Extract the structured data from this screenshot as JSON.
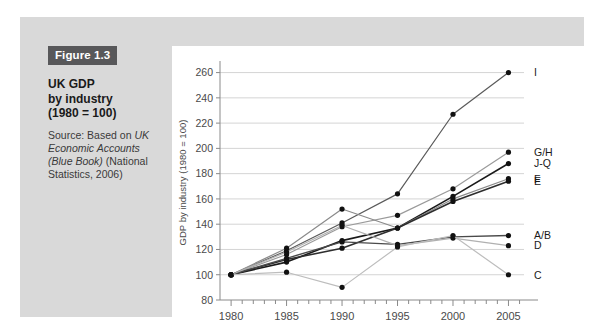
{
  "caption": {
    "tag": "Figure 1.3",
    "title_line1": "UK GDP",
    "title_line2": "by industry",
    "title_line3": "(1980 = 100)",
    "source_prefix": "Source: Based on ",
    "source_italic1": "UK Economic Accounts (Blue Book)",
    "source_suffix": " (National Statistics, 2006)"
  },
  "colors": {
    "panel_background": "#d9d9d9",
    "plot_background": "#ffffff",
    "tag_background": "#58585a",
    "tag_text": "#ffffff",
    "gridline": "#c9c9c9",
    "axis": "#8a8a8a",
    "axis_text": "#4a4a4a"
  },
  "chart_data": {
    "type": "line",
    "title": "UK GDP by industry (1980 = 100)",
    "xlabel": "",
    "ylabel": "GDP by industry (1980 = 100)",
    "x": [
      1980,
      1985,
      1990,
      1995,
      2000,
      2005
    ],
    "xtick_labels": [
      "1980",
      "1985",
      "1990",
      "1995",
      "2000",
      "2005"
    ],
    "ytick_labels": [
      "80",
      "100",
      "120",
      "140",
      "160",
      "180",
      "200",
      "220",
      "240",
      "260"
    ],
    "ytick_values": [
      80,
      100,
      120,
      140,
      160,
      180,
      200,
      220,
      240,
      260
    ],
    "xlim": [
      1979,
      2006.4
    ],
    "ylim": [
      80,
      266
    ],
    "grid": true,
    "legend_position": "right-inline-labels",
    "minor_xticks_every": 1,
    "series": [
      {
        "name": "I",
        "label": "I",
        "color": "#5a5a5a",
        "width": 1.2,
        "values": [
          100,
          119,
          141,
          164,
          227,
          260
        ]
      },
      {
        "name": "G/H",
        "label": "G/H",
        "color": "#9a9a9a",
        "width": 1.2,
        "values": [
          100,
          116,
          138,
          147,
          168,
          197
        ]
      },
      {
        "name": "J-Q",
        "label": "J-Q",
        "color": "#1a1a1a",
        "width": 1.6,
        "values": [
          100,
          110,
          127,
          137,
          162,
          188
        ]
      },
      {
        "name": "F",
        "label": "F",
        "color": "#8a8a8a",
        "width": 1.2,
        "values": [
          100,
          121,
          152,
          137,
          160,
          176
        ]
      },
      {
        "name": "E",
        "label": "E",
        "color": "#2e2e2e",
        "width": 1.6,
        "values": [
          100,
          112,
          121,
          137,
          158,
          174
        ]
      },
      {
        "name": "A/B",
        "label": "A/B",
        "color": "#4a4a4a",
        "width": 1.4,
        "values": [
          100,
          113,
          126,
          124,
          130,
          131
        ]
      },
      {
        "name": "D",
        "label": "D",
        "color": "#b0b0b0",
        "width": 1.2,
        "values": [
          100,
          118,
          139,
          123,
          129,
          123
        ]
      },
      {
        "name": "C",
        "label": "C",
        "color": "#bdbdbd",
        "width": 1.2,
        "values": [
          100,
          102,
          90,
          122,
          131,
          100
        ]
      }
    ]
  }
}
